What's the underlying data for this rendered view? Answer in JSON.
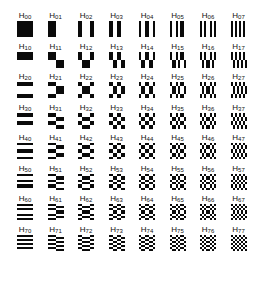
{
  "figure": {
    "label_prefix": "H",
    "grid_size": 8,
    "origin": {
      "x": 10,
      "y": 12
    },
    "spacing": {
      "x": 30.5,
      "y": 30.5
    },
    "colors": {
      "positive": "#0a0a0a",
      "negative": "#ffffff",
      "label": "#111111"
    },
    "ordering": "sequency",
    "labels": [
      [
        "H00",
        "H01",
        "H02",
        "H03",
        "H04",
        "H05",
        "H06",
        "H07"
      ],
      [
        "H10",
        "H11",
        "H12",
        "H13",
        "H14",
        "H15",
        "H16",
        "H17"
      ],
      [
        "H20",
        "H21",
        "H22",
        "H23",
        "H24",
        "H25",
        "H26",
        "H27"
      ],
      [
        "H30",
        "H31",
        "H32",
        "H33",
        "H34",
        "H35",
        "H36",
        "H37"
      ],
      [
        "H40",
        "H41",
        "H42",
        "H43",
        "H44",
        "H45",
        "H46",
        "H47"
      ],
      [
        "H50",
        "H51",
        "H52",
        "H53",
        "H54",
        "H55",
        "H56",
        "H57"
      ],
      [
        "H60",
        "H61",
        "H62",
        "H63",
        "H64",
        "H65",
        "H66",
        "H67"
      ],
      [
        "H70",
        "H71",
        "H72",
        "H73",
        "H74",
        "H75",
        "H76",
        "H77"
      ]
    ]
  }
}
